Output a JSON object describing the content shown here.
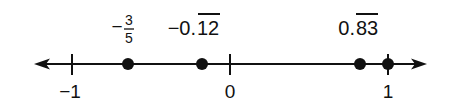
{
  "diagram": {
    "type": "number-line",
    "colors": {
      "ink": "#111111",
      "background": "#ffffff"
    },
    "axis": {
      "y": 64,
      "x_start": 36,
      "x_end": 425,
      "arrows": "both",
      "unit_px": 158,
      "origin_px": 230
    },
    "ticks": [
      {
        "value": -1,
        "label": "−1",
        "x": 72
      },
      {
        "value": 0,
        "label": "0",
        "x": 230
      },
      {
        "value": 1,
        "label": "1",
        "x": 388
      }
    ],
    "points": [
      {
        "value": -0.6,
        "x": 128,
        "label_type": "fraction",
        "sign": "−",
        "numerator": "3",
        "denominator": "5"
      },
      {
        "value": -0.1212,
        "x": 202,
        "label_type": "repeating",
        "prefix": "−0.",
        "repeat": "12"
      },
      {
        "value": 0.8383,
        "x": 360,
        "label_type": "repeating",
        "prefix": "0.",
        "repeat": "83"
      },
      {
        "value": 1,
        "x": 388,
        "label_type": "none"
      }
    ]
  },
  "labels": {
    "p0_sign": "−",
    "p0_num": "3",
    "p0_den": "5",
    "p1_prefix": "−0.",
    "p1_repeat": "12",
    "p2_prefix": "0.",
    "p2_repeat": "83",
    "t0": "−1",
    "t1": "0",
    "t2": "1"
  }
}
